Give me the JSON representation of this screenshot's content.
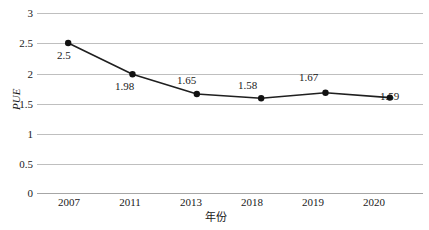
{
  "chart_data": {
    "type": "line",
    "title": "",
    "xlabel": "年份",
    "ylabel": "PUE",
    "categories": [
      "2007",
      "2011",
      "2013",
      "2018",
      "2019",
      "2020"
    ],
    "values": [
      2.5,
      1.98,
      1.65,
      1.58,
      1.67,
      1.59
    ],
    "point_labels": [
      "2.5",
      "1.98",
      "1.65",
      "1.58",
      "1.67",
      "1.59"
    ],
    "series": [
      {
        "name": "PUE",
        "values": [
          2.5,
          1.98,
          1.65,
          1.58,
          1.67,
          1.59
        ]
      }
    ],
    "ylim": [
      0,
      3
    ],
    "yticks": [
      "0",
      "0.5",
      "1",
      "1.5",
      "2",
      "2.5",
      "3"
    ],
    "ytick_values": [
      0,
      0.5,
      1,
      1.5,
      2,
      2.5,
      3
    ],
    "grid": true,
    "legend": "none",
    "colors": {
      "line": "#1f1f1f",
      "marker": "#111111",
      "gridline": "#bfbfbf",
      "axis": "#a6a6a6",
      "text": "#1a1a1a",
      "background": "#ffffff"
    }
  }
}
